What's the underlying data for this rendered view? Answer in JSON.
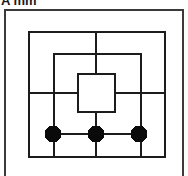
{
  "caption": {
    "text": "A mm",
    "note": "cropped top caption line"
  },
  "figure": {
    "background_color": "#ffffff",
    "frame_color": "#3a3a3a",
    "line_color": "#1c1c1c",
    "node_fill_color": "#0a0a0a"
  },
  "diagram": {
    "type": "schematic",
    "viewbox": "0 0 180 172",
    "squares": [
      {
        "name": "outer-square",
        "x": 23,
        "y": 21,
        "width": 136,
        "height": 125,
        "stroke_width": 2.6
      },
      {
        "name": "middle-square",
        "x": 48,
        "y": 43,
        "width": 87,
        "height": 103,
        "stroke_width": 2.6
      },
      {
        "name": "inner-square",
        "x": 72,
        "y": 63,
        "width": 37,
        "height": 38,
        "stroke_width": 2.2
      }
    ],
    "lines": [
      {
        "name": "vertical-axis",
        "x1": 90,
        "y1": 21,
        "x2": 90,
        "y2": 146,
        "stroke_width": 2.6
      },
      {
        "name": "horizontal-axis",
        "x1": 23,
        "y1": 82,
        "x2": 159,
        "y2": 82,
        "stroke_width": 2.6
      },
      {
        "name": "node-connector",
        "x1": 47,
        "y1": 123,
        "x2": 133,
        "y2": 123,
        "stroke_width": 2.6
      }
    ],
    "nodes": [
      {
        "name": "node-left",
        "cx": 47,
        "cy": 123,
        "r": 8.5
      },
      {
        "name": "node-center",
        "cx": 90,
        "cy": 123,
        "r": 8.5
      },
      {
        "name": "node-right",
        "cx": 133,
        "cy": 123,
        "r": 8.5
      }
    ],
    "node_count": 3,
    "square_count": 3
  }
}
